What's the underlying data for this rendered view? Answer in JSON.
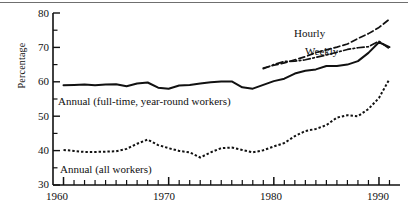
{
  "chart_data": {
    "type": "line",
    "title": "",
    "xlabel": "",
    "ylabel": "Percentage",
    "xlim": [
      1959,
      1992
    ],
    "ylim": [
      30,
      80
    ],
    "ymajor": [
      30,
      40,
      50,
      60,
      70,
      80
    ],
    "yminor": [
      35,
      45,
      55,
      65,
      75
    ],
    "xticklabels": [
      "1960",
      "1970",
      "1980",
      "1990"
    ],
    "xticks": [
      1960,
      1970,
      1980,
      1990
    ],
    "xtick_every": 1,
    "grid": false,
    "legend": "inline-annotations",
    "series": [
      {
        "name": "Annual (full-time, year-round workers)",
        "style": "solid",
        "x": [
          1960,
          1961,
          1962,
          1963,
          1964,
          1965,
          1966,
          1967,
          1968,
          1969,
          1970,
          1971,
          1972,
          1973,
          1974,
          1975,
          1976,
          1977,
          1978,
          1979,
          1980,
          1981,
          1982,
          1983,
          1984,
          1985,
          1986,
          1987,
          1988,
          1989,
          1990,
          1991
        ],
        "values": [
          59.0,
          59.1,
          59.2,
          59.0,
          59.2,
          59.3,
          58.7,
          59.5,
          59.8,
          58.3,
          58.0,
          58.9,
          59.1,
          59.5,
          59.9,
          60.1,
          60.1,
          58.4,
          58.0,
          59.1,
          60.2,
          60.9,
          62.4,
          63.2,
          63.6,
          64.6,
          64.6,
          65.0,
          66.0,
          68.4,
          71.5,
          70.1
        ]
      },
      {
        "name": "Annual (all workers)",
        "style": "dotted",
        "x": [
          1960,
          1961,
          1962,
          1963,
          1964,
          1965,
          1966,
          1967,
          1968,
          1969,
          1970,
          1971,
          1972,
          1973,
          1974,
          1975,
          1976,
          1977,
          1978,
          1979,
          1980,
          1981,
          1982,
          1983,
          1984,
          1985,
          1986,
          1987,
          1988,
          1989,
          1990,
          1991
        ],
        "values": [
          40.2,
          39.9,
          39.6,
          39.6,
          39.7,
          39.8,
          40.5,
          42.0,
          43.2,
          41.6,
          40.7,
          39.9,
          39.5,
          38.0,
          39.5,
          40.7,
          40.9,
          40.2,
          39.5,
          40.1,
          41.2,
          42.2,
          44.2,
          45.7,
          46.3,
          47.4,
          49.6,
          50.3,
          50.0,
          52.1,
          55.3,
          60.8
        ]
      },
      {
        "name": "Hourly",
        "style": "dashed",
        "x": [
          1979,
          1980,
          1981,
          1982,
          1983,
          1984,
          1985,
          1986,
          1987,
          1988,
          1989,
          1990,
          1991
        ],
        "values": [
          64.0,
          64.8,
          65.5,
          66.4,
          67.3,
          68.5,
          69.3,
          70.1,
          71.0,
          72.6,
          74.0,
          75.8,
          78.2
        ]
      },
      {
        "name": "Weekly",
        "style": "dashdot",
        "x": [
          1979,
          1980,
          1981,
          1982,
          1983,
          1984,
          1985,
          1986,
          1987,
          1988,
          1989,
          1990,
          1991
        ],
        "values": [
          63.8,
          65.0,
          65.9,
          66.0,
          66.4,
          67.1,
          67.8,
          68.6,
          69.4,
          69.9,
          70.2,
          71.8,
          69.6
        ]
      }
    ],
    "annotations": [
      {
        "text": "Annual (full-time, year-round workers)",
        "x": 1960.5,
        "y": 55.5
      },
      {
        "text": "Annual (all workers)",
        "x": 1960.7,
        "y": 35.6
      },
      {
        "text": "Hourly",
        "x": 1981.5,
        "y": 73.6
      },
      {
        "text": "Weekly",
        "x": 1982.5,
        "y": 68.6
      }
    ]
  },
  "axis": {
    "ylabel": "Percentage",
    "yticks": [
      "80",
      "70",
      "60",
      "50",
      "40",
      "30"
    ],
    "xticks": [
      "1960",
      "1970",
      "1980",
      "1990"
    ]
  },
  "labels": {
    "annual_fulltime": "Annual (full-time, year-round workers)",
    "annual_all": "Annual (all workers)",
    "hourly": "Hourly",
    "weekly": "Weekly"
  },
  "colors": {
    "ink": "#111111",
    "rule": "#6f6f6f",
    "background": "#ffffff"
  }
}
